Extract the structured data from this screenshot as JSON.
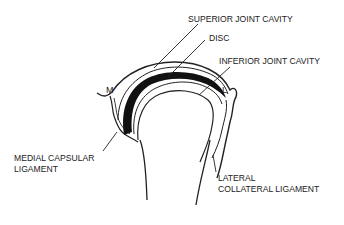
{
  "diagram": {
    "labels": {
      "superior_joint_cavity": "SUPERIOR JOINT CAVITY",
      "disc": "DISC",
      "inferior_joint_cavity": "INFERIOR JOINT CAVITY",
      "medial_capsular_ligament_line1": "MEDIAL CAPSULAR",
      "medial_capsular_ligament_line2": "LIGAMENT",
      "lateral_collateral_ligament_line1": "LATERAL",
      "lateral_collateral_ligament_line2": "COLLATERAL LIGAMENT",
      "medial_marker": "M",
      "lateral_marker": "L"
    }
  }
}
